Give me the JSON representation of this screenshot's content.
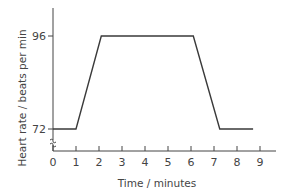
{
  "chart_data": {
    "type": "line",
    "title": "",
    "xlabel": "Time / minutes",
    "ylabel": "Heart rate / beats per min",
    "x_ticks": [
      0,
      1,
      2,
      3,
      4,
      5,
      6,
      7,
      8,
      9
    ],
    "x_tick_labels": [
      "0",
      "1",
      "2",
      "3",
      "4",
      "5",
      "6",
      "7",
      "8",
      "9"
    ],
    "y_ticks": [
      72,
      96
    ],
    "y_tick_labels": [
      "72",
      "96"
    ],
    "xlim": [
      0,
      9.6
    ],
    "y_axis_break": true,
    "grid": false,
    "legend": "none",
    "series": [
      {
        "name": "Heart rate",
        "x": [
          0,
          1,
          2.1,
          6.1,
          7.25,
          8.7
        ],
        "y": [
          72,
          72,
          96,
          96,
          72,
          72
        ]
      }
    ]
  }
}
